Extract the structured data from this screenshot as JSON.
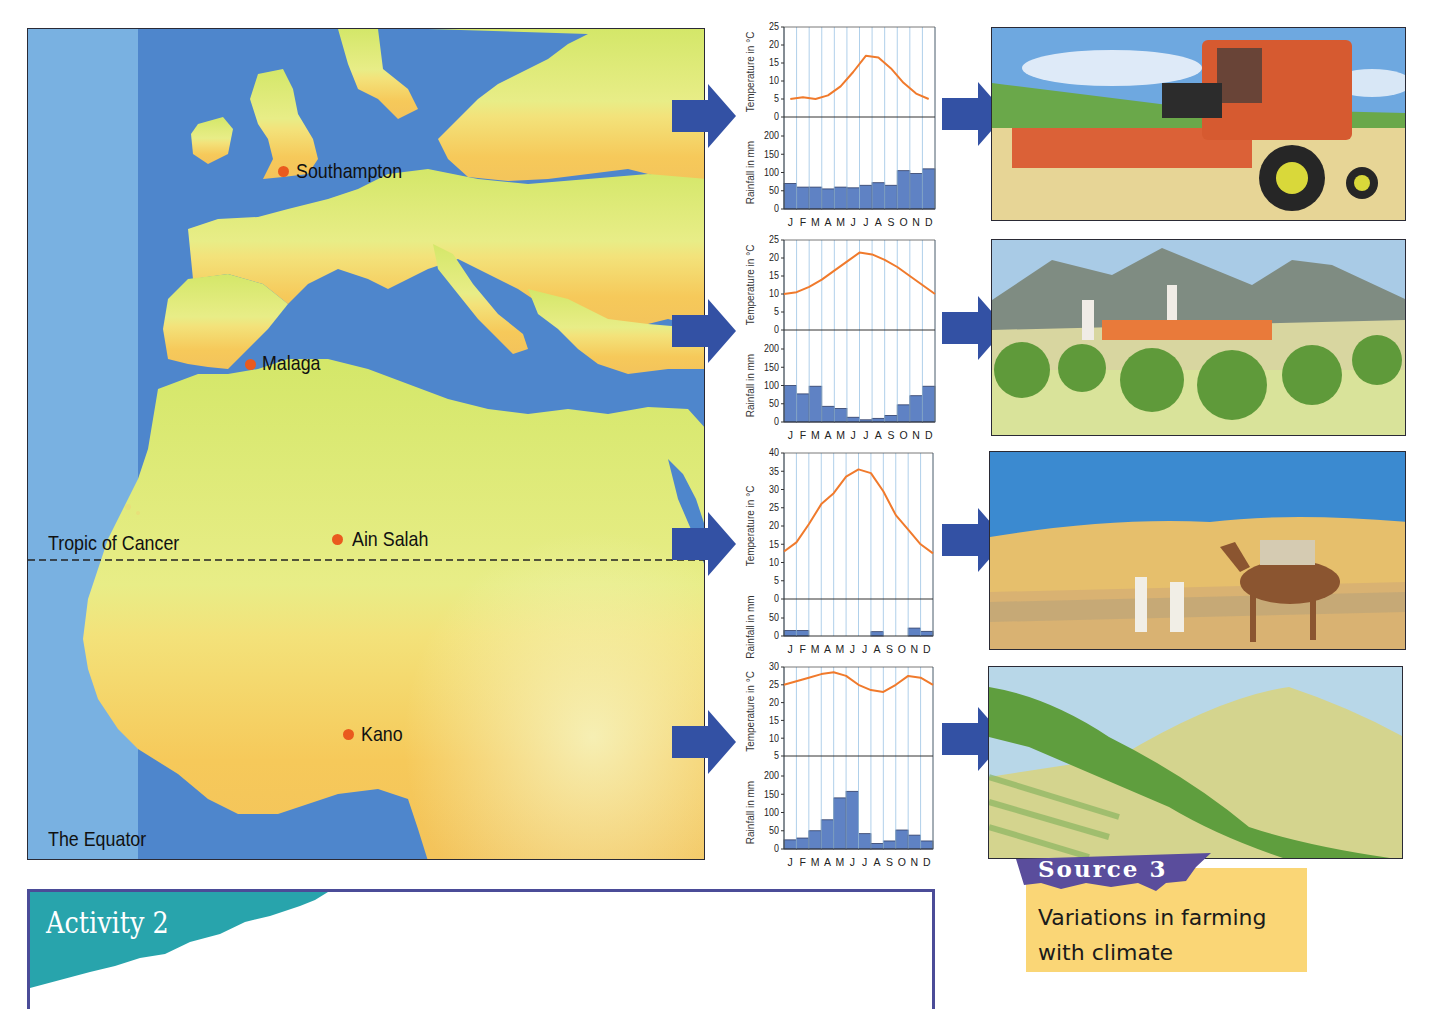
{
  "map": {
    "cities": [
      {
        "name": "Southampton"
      },
      {
        "name": "Malaga"
      },
      {
        "name": "Ain Salah"
      },
      {
        "name": "Kano"
      }
    ],
    "lines": {
      "tropic_label": "Tropic of Cancer",
      "equator_label": "The Equator"
    },
    "colors": {
      "sea": "#4e86cc",
      "land_north": "#d9e86a",
      "land_south": "#f4c24f",
      "city_dot": "#ea5a1e"
    }
  },
  "arrow_icon": "right-arrow-icon",
  "arrow_color": "#3351a4",
  "chart_data": [
    {
      "type": "bar+line",
      "location": "Southampton",
      "categories": [
        "J",
        "F",
        "M",
        "A",
        "M",
        "J",
        "J",
        "A",
        "S",
        "O",
        "N",
        "D"
      ],
      "temperature": {
        "label": "Temperature in °C",
        "ylim": [
          0,
          25
        ],
        "ticks": [
          0,
          5,
          10,
          15,
          20,
          25
        ],
        "values": [
          5,
          5.5,
          5,
          6,
          8.5,
          12.5,
          17,
          16.5,
          13.5,
          9.5,
          6.5,
          5
        ]
      },
      "rainfall": {
        "label": "Rainfall in mm",
        "ylim": [
          0,
          200
        ],
        "ticks": [
          0,
          50,
          100,
          150,
          200
        ],
        "values": [
          70,
          60,
          60,
          55,
          60,
          58,
          65,
          72,
          65,
          105,
          97,
          110
        ]
      },
      "line_color": "#f07a2c",
      "bar_color": "#5f82c4"
    },
    {
      "type": "bar+line",
      "location": "Malaga",
      "categories": [
        "J",
        "F",
        "M",
        "A",
        "M",
        "J",
        "J",
        "A",
        "S",
        "O",
        "N",
        "D"
      ],
      "temperature": {
        "label": "Temperature in °C",
        "ylim": [
          0,
          25
        ],
        "ticks": [
          0,
          5,
          10,
          15,
          20,
          25
        ],
        "values": [
          10,
          10.5,
          12,
          14,
          16.5,
          19,
          21.5,
          21,
          19.5,
          17.5,
          15,
          12.5,
          10
        ]
      },
      "rainfall": {
        "label": "Rainfall in mm",
        "ylim": [
          0,
          200
        ],
        "ticks": [
          0,
          50,
          100,
          150,
          200
        ],
        "values": [
          100,
          77,
          98,
          43,
          37,
          13,
          6,
          10,
          18,
          47,
          72,
          98
        ]
      },
      "line_color": "#f07a2c",
      "bar_color": "#5f82c4"
    },
    {
      "type": "bar+line",
      "location": "Ain Salah",
      "categories": [
        "J",
        "F",
        "M",
        "A",
        "M",
        "J",
        "J",
        "A",
        "S",
        "O",
        "N",
        "D"
      ],
      "temperature": {
        "label": "Temperature in °C",
        "ylim": [
          0,
          40
        ],
        "ticks": [
          0,
          5,
          10,
          15,
          20,
          25,
          30,
          35,
          40
        ],
        "values": [
          13,
          15.5,
          20.5,
          26,
          29,
          33.5,
          35.5,
          34.5,
          29.5,
          23,
          19,
          15,
          12.5
        ]
      },
      "rainfall": {
        "label": "Rainfall in mm",
        "ylim": [
          0,
          50
        ],
        "ticks": [
          0,
          50
        ],
        "values": [
          15,
          15,
          0,
          0,
          0,
          0,
          0,
          12,
          0,
          0,
          22,
          13
        ]
      },
      "line_color": "#f07a2c",
      "bar_color": "#5f82c4"
    },
    {
      "type": "bar+line",
      "location": "Kano",
      "categories": [
        "J",
        "F",
        "M",
        "A",
        "M",
        "J",
        "J",
        "A",
        "S",
        "O",
        "N",
        "D"
      ],
      "temperature": {
        "label": "Temperature in °C",
        "ylim": [
          5,
          30
        ],
        "ticks": [
          5,
          10,
          15,
          20,
          25,
          30
        ],
        "values": [
          25,
          26,
          27,
          28,
          28.5,
          27.5,
          25,
          23.5,
          23,
          25,
          27.5,
          27,
          25
        ]
      },
      "rainfall": {
        "label": "Rainfall in mm",
        "ylim": [
          0,
          200
        ],
        "ticks": [
          0,
          50,
          100,
          150,
          200
        ],
        "values": [
          25,
          30,
          50,
          80,
          140,
          158,
          42,
          15,
          22,
          52,
          38,
          22
        ]
      },
      "line_color": "#f07a2c",
      "bar_color": "#5f82c4"
    }
  ],
  "photos": [
    {
      "subject": "combine-harvester-wheat-field"
    },
    {
      "subject": "mediterranean-village-orchards"
    },
    {
      "subject": "desert-nomads-with-camel"
    },
    {
      "subject": "tropical-crops-hillside"
    }
  ],
  "activity": {
    "title": "Activity 2",
    "header_color": "#28a4ac",
    "border_color": "#4b4c98"
  },
  "source": {
    "title": "Source 3",
    "caption": "Variations in farming with climate",
    "tab_color": "#5a4d9c",
    "box_color": "#fad676"
  }
}
